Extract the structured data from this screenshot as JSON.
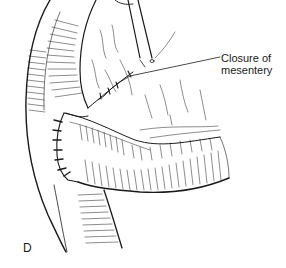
{
  "figure": {
    "type": "surgical line illustration",
    "panel_letter": "D",
    "callouts": [
      {
        "line1": "Closure of",
        "line2": "mesentery",
        "points_to": "suture line on mesentery"
      }
    ],
    "colors": {
      "ink": "#1a1a1a",
      "background": "#ffffff"
    }
  }
}
